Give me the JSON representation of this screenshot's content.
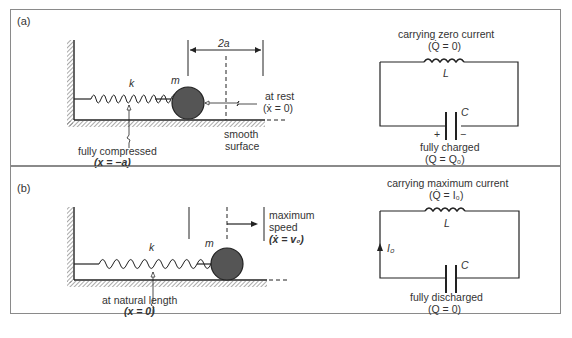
{
  "panels": {
    "a": {
      "tag": "(a)",
      "mech": {
        "spring_label": "k",
        "mass_label": "m",
        "distance_label": "2a",
        "state_label": "at rest",
        "state_eq": "(ẋ = 0)",
        "surface_label_1": "smooth",
        "surface_label_2": "surface",
        "spring_label_1": "fully compressed",
        "spring_eq": "(x = −a)"
      },
      "circuit": {
        "top_label": "carrying zero current",
        "top_eq": "(Q̇ = 0)",
        "inductor": "L",
        "capacitor": "C",
        "plus": "+",
        "minus": "−",
        "bottom_label": "fully charged",
        "bottom_eq": "(Q = Q₀)"
      }
    },
    "b": {
      "tag": "(b)",
      "mech": {
        "spring_label": "k",
        "mass_label": "m",
        "state_label_1": "maximum",
        "state_label_2": "speed",
        "state_eq": "(ẋ = v₀)",
        "spring_label_1": "at natural length",
        "spring_eq": "(x = 0)"
      },
      "circuit": {
        "top_label": "carrying maximum current",
        "top_eq": "(Q̇ = I₀)",
        "inductor": "L",
        "capacitor": "C",
        "current": "I₀",
        "bottom_label": "fully discharged",
        "bottom_eq": "(Q = 0)"
      }
    }
  }
}
